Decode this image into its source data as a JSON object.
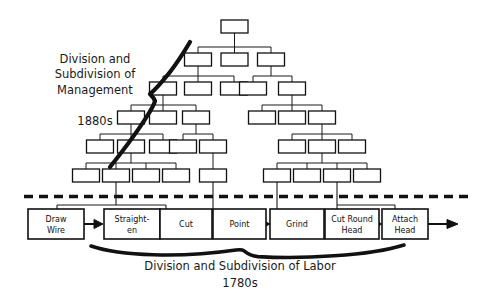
{
  "diagram": {
    "title_management": "Division and\nSubdivision of\nManagement",
    "year_management": "1880s",
    "title_labor": "Division and Subdivision of Labor",
    "year_labor": "1780s",
    "colors": {
      "line": "#1a1a1a",
      "box_fill": "#ffffff",
      "box_stroke": "#111111",
      "brace": "#111111",
      "background": "#ffffff"
    },
    "process_steps": [
      {
        "id": "draw-wire",
        "label": "Draw\nWire",
        "line1": "Draw",
        "line2": "Wire"
      },
      {
        "id": "straighten",
        "label": "Straight-\nen",
        "line1": "Straight-",
        "line2": "en"
      },
      {
        "id": "cut",
        "label": "Cut",
        "line1": "Cut",
        "line2": ""
      },
      {
        "id": "point",
        "label": "Point",
        "line1": "Point",
        "line2": ""
      },
      {
        "id": "grind",
        "label": "Grind",
        "line1": "Grind",
        "line2": ""
      },
      {
        "id": "cut-round-head",
        "label": "Cut Round\nHead",
        "line1": "Cut Round",
        "line2": "Head"
      },
      {
        "id": "attach-head",
        "label": "Attach\nHead",
        "line1": "Attach",
        "line2": "Head"
      }
    ],
    "org_chart": {
      "levels": [
        {
          "level": 1,
          "count": 1
        },
        {
          "level": 2,
          "count": 3
        },
        {
          "level": 3,
          "count": 5
        },
        {
          "level": 4,
          "count": 6
        },
        {
          "level": 5,
          "count": 8
        },
        {
          "level": 6,
          "count": 9
        }
      ],
      "total_boxes": 32,
      "box_labels_visible": false
    },
    "divider": {
      "style": "dashed",
      "label": ""
    }
  }
}
